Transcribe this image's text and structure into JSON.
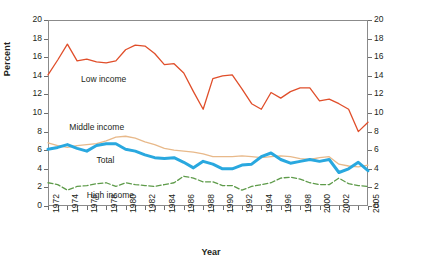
{
  "chart_data": {
    "type": "line",
    "title": "",
    "xlabel": "Year",
    "ylabel": "Percent",
    "ylim": [
      0,
      20
    ],
    "ytick_step": 2,
    "xlim": [
      1972,
      2005
    ],
    "grid": false,
    "legend_position": "inline-annotations",
    "dual_y_axis": true,
    "y_ticks": [
      "0",
      "2",
      "4",
      "6",
      "8",
      "10",
      "12",
      "14",
      "16",
      "18",
      "20"
    ],
    "x_tick_labels": [
      "1972",
      "1974",
      "1976",
      "1978",
      "1980",
      "1982",
      "1984",
      "1986",
      "1988",
      "1990",
      "1992",
      "1994",
      "1996",
      "1998",
      "2000",
      "2002",
      "2005"
    ],
    "x": [
      1972,
      1973,
      1974,
      1975,
      1976,
      1977,
      1978,
      1979,
      1980,
      1981,
      1982,
      1983,
      1984,
      1985,
      1986,
      1987,
      1988,
      1989,
      1990,
      1991,
      1992,
      1993,
      1994,
      1995,
      1996,
      1997,
      1998,
      1999,
      2000,
      2001,
      2002,
      2003,
      2004,
      2005
    ],
    "series": [
      {
        "name": "Low income",
        "color": "#e04e2a",
        "style": "solid",
        "values": [
          14.1,
          15.7,
          17.4,
          15.6,
          15.8,
          15.5,
          15.4,
          15.6,
          16.8,
          17.3,
          17.2,
          16.4,
          15.2,
          15.3,
          14.3,
          12.3,
          10.4,
          13.7,
          14.0,
          14.1,
          12.6,
          11.0,
          10.4,
          12.2,
          11.6,
          12.3,
          12.7,
          12.7,
          11.3,
          11.5,
          11.0,
          10.4,
          8.0,
          9.0
        ]
      },
      {
        "name": "Middle income",
        "color": "#e8b98a",
        "style": "solid",
        "values": [
          6.8,
          6.5,
          6.3,
          6.5,
          6.6,
          6.7,
          7.0,
          7.4,
          7.5,
          7.3,
          6.9,
          6.6,
          6.2,
          6.0,
          5.9,
          5.8,
          5.6,
          5.3,
          5.3,
          5.3,
          5.4,
          5.3,
          5.2,
          5.3,
          5.4,
          5.3,
          5.1,
          5.0,
          5.2,
          5.3,
          4.5,
          4.3,
          4.2,
          4.4
        ]
      },
      {
        "name": "Total",
        "color": "#29a8df",
        "style": "solid",
        "values": [
          6.1,
          6.3,
          6.6,
          6.2,
          5.9,
          6.5,
          6.7,
          6.7,
          6.1,
          5.9,
          5.5,
          5.2,
          5.1,
          5.2,
          4.7,
          4.1,
          4.8,
          4.5,
          4.0,
          4.0,
          4.4,
          4.5,
          5.3,
          5.7,
          5.0,
          4.6,
          4.8,
          5.0,
          4.8,
          5.0,
          3.6,
          4.0,
          4.7,
          3.8
        ]
      },
      {
        "name": "High income",
        "color": "#5e9b4a",
        "style": "dashed",
        "values": [
          2.5,
          2.3,
          1.7,
          2.1,
          2.2,
          2.4,
          2.5,
          2.1,
          2.5,
          2.3,
          2.2,
          2.1,
          2.3,
          2.5,
          3.2,
          3.0,
          2.6,
          2.6,
          2.2,
          2.2,
          1.7,
          2.1,
          2.3,
          2.5,
          3.0,
          3.1,
          2.9,
          2.5,
          2.3,
          2.3,
          3.0,
          2.4,
          2.2,
          2.1
        ]
      }
    ],
    "annotations": [
      {
        "text": "Low income",
        "x": 1975.4,
        "y": 13.6
      },
      {
        "text": "Middle income",
        "x": 1974.2,
        "y": 8.4
      },
      {
        "text": "Total",
        "x": 1977.0,
        "y": 4.8
      },
      {
        "text": "High income",
        "x": 1976.0,
        "y": 1.1
      }
    ]
  }
}
